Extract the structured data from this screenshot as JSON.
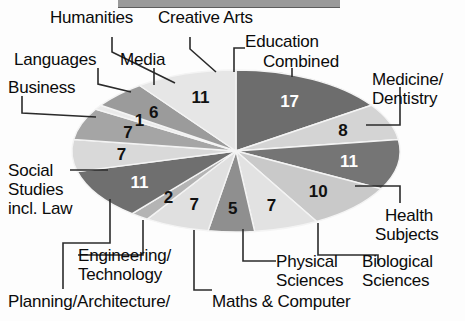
{
  "chart_data": {
    "type": "pie",
    "title": "",
    "subtitle": "",
    "xlabel": "",
    "ylabel": "",
    "legend_position": "callout-labels",
    "grid": false,
    "units": "percent",
    "total": 110,
    "note": "Percentage share by subject area; values shown inside slices",
    "categories": [
      "Education Combined",
      "Medicine/ Dentistry",
      "Health Subjects",
      "Biological Sciences",
      "Physical Sciences",
      "Maths & Computer",
      "Planning/Architecture/",
      "Engineering/ Technology",
      "Social Studies incl. Law",
      "Business",
      "Languages",
      "Humanities",
      "Media",
      "Creative Arts"
    ],
    "values": [
      17,
      8,
      11,
      10,
      7,
      5,
      7,
      2,
      11,
      7,
      7,
      1,
      6,
      11
    ],
    "slice_label_colors": [
      "#ffffff",
      "#111111",
      "#ffffff",
      "#111111",
      "#111111",
      "#111111",
      "#111111",
      "#111111",
      "#ffffff",
      "#111111",
      "#111111",
      "#111111",
      "#111111",
      "#111111"
    ],
    "slice_fills": [
      "#6d6d6d",
      "#d4d4d4",
      "#757575",
      "#c9c9c9",
      "#e2e2e2",
      "#8f8f8f",
      "#e0e0e0",
      "#b4b4b4",
      "#6f6f6f",
      "#d9d9d9",
      "#a5a5a5",
      "#eaeaea",
      "#9b9b9b",
      "#e6e6e6"
    ]
  },
  "palette": {
    "background": "#fdfdfd",
    "text": "#0b0b0b",
    "leader_line": "#2b2b2b",
    "slice_outline": "#f4f4f4",
    "topbar": "#9a9a9a"
  },
  "slice_values": {
    "education_combined": "17",
    "medicine_dentistry": "8",
    "health_subjects": "11",
    "biological_sciences": "10",
    "physical_sciences": "7",
    "maths_computer": "5",
    "planning_architecture": "7",
    "engineering_technology": "2",
    "social_studies": "11",
    "business": "7",
    "languages": "7",
    "humanities": "1",
    "media": "6",
    "creative_arts": "11"
  },
  "labels": {
    "humanities": "Humanities",
    "creative_arts": "Creative Arts",
    "education_line1": "Education",
    "education_line2": "Combined",
    "languages": "Languages",
    "media": "Media",
    "medicine_line1": "Medicine/",
    "medicine_line2": "Dentistry",
    "business": "Business",
    "social_line1": "Social",
    "social_line2": "Studies",
    "social_line3": "incl. Law",
    "health_line1": "Health",
    "health_line2": "Subjects",
    "engineering_line1": "Engineering/",
    "engineering_line2": "Technology",
    "physical_line1": "Physical",
    "physical_line2": "Sciences",
    "biological_line1": "Biological",
    "biological_line2": "Sciences",
    "planning": "Planning/Architecture/",
    "maths": "Maths & Computer"
  }
}
